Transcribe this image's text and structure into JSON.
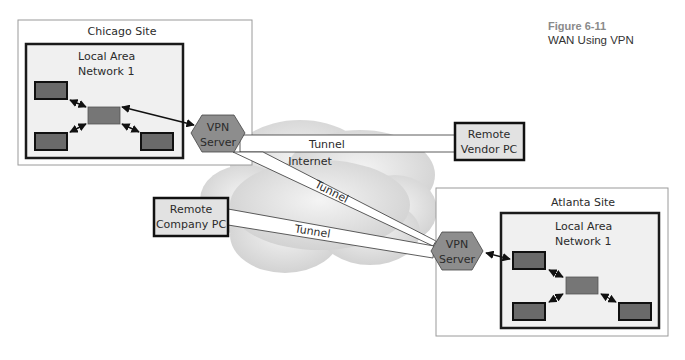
{
  "figure": {
    "number": "Figure 6-11",
    "title": "WAN Using VPN"
  },
  "colors": {
    "site_fill": "#ffffff",
    "site_border": "#9a9a9a",
    "lan_fill": "#f0f0f0",
    "lan_border": "#1a1a1a",
    "device_fill": "#6a6a6a",
    "hub_fill": "#767676",
    "vpn_fill": "#8d8d8d",
    "pc_fill": "#e2e2e2",
    "cloud_fill": "#d6d6d6",
    "tunnel_fill": "#ffffff"
  },
  "sites": [
    {
      "id": "chicago",
      "label": "Chicago Site",
      "lan_label_line1": "Local Area",
      "lan_label_line2": "Network 1",
      "vpn_line1": "VPN",
      "vpn_line2": "Server"
    },
    {
      "id": "atlanta",
      "label": "Atlanta Site",
      "lan_label_line1": "Local Area",
      "lan_label_line2": "Network 1",
      "vpn_line1": "VPN",
      "vpn_line2": "Server"
    }
  ],
  "internet": {
    "label": "Internet"
  },
  "remote_pcs": [
    {
      "id": "vendor",
      "line1": "Remote",
      "line2": "Vendor PC"
    },
    {
      "id": "company",
      "line1": "Remote",
      "line2": "Company PC"
    }
  ],
  "tunnels": [
    {
      "from": "Chicago VPN Server",
      "to": "Remote Vendor PC",
      "label": "Tunnel"
    },
    {
      "from": "Chicago VPN Server",
      "to": "Atlanta VPN Server",
      "label": "Tunnel"
    },
    {
      "from": "Remote Company PC",
      "to": "Atlanta VPN Server",
      "label": "Tunnel"
    }
  ]
}
